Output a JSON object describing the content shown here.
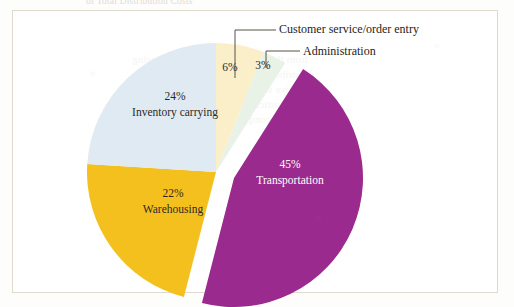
{
  "figure": {
    "caption_clipped": "of Total Distribution Costs",
    "frame_border_color": "#dfd9cf",
    "background_color": "#ffffff"
  },
  "chart_data": {
    "type": "pie",
    "title": "",
    "subtitle": "",
    "xlabel": "",
    "ylabel": "",
    "legend_position": "none",
    "grid": false,
    "total": 100,
    "unit": "%",
    "exploded_slice": "Transportation",
    "start_angle_deg": -90,
    "direction": "clockwise",
    "categories": [
      "Customer service/order entry",
      "Administration",
      "Transportation",
      "Warehousing",
      "Inventory carrying"
    ],
    "values": [
      6,
      3,
      45,
      22,
      24
    ],
    "colors": [
      "#faefc8",
      "#e9f2e6",
      "#9b2a8e",
      "#f4c01e",
      "#dfeaf3"
    ],
    "slices": [
      {
        "name": "Customer service/order entry",
        "value": 6,
        "value_label": "6%",
        "color": "#faefc8",
        "label_placement": "inside",
        "callout": true,
        "callout_text": "Customer service/order entry"
      },
      {
        "name": "Administration",
        "value": 3,
        "value_label": "3%",
        "color": "#e9f2e6",
        "label_placement": "inside",
        "callout": true,
        "callout_text": "Administration"
      },
      {
        "name": "Transportation",
        "value": 45,
        "value_label": "45%",
        "color": "#9b2a8e",
        "label_placement": "inside",
        "label_color": "#ffffff",
        "callout": false,
        "exploded": true
      },
      {
        "name": "Warehousing",
        "value": 22,
        "value_label": "22%",
        "color": "#f4c01e",
        "label_placement": "inside",
        "callout": false
      },
      {
        "name": "Inventory carrying",
        "value": 24,
        "value_label": "24%",
        "color": "#dfeaf3",
        "label_placement": "inside",
        "callout": false
      }
    ]
  },
  "labels": {
    "transportation": {
      "pct": "45%",
      "name": "Transportation"
    },
    "inventory": {
      "pct": "24%",
      "name": "Inventory carrying"
    },
    "warehousing": {
      "pct": "22%",
      "name": "Warehousing"
    },
    "customer_service": {
      "pct": "6%",
      "name": "Customer service/order entry"
    },
    "administration": {
      "pct": "3%",
      "name": "Administration"
    }
  }
}
